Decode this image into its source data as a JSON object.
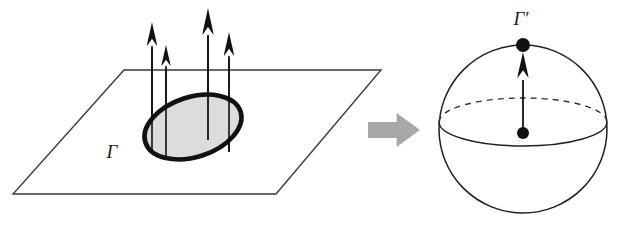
{
  "figure": {
    "kind": "mathematical-diagram",
    "width": 625,
    "height": 226,
    "background_color": "#ffffff"
  },
  "colors": {
    "stroke": "#231f20",
    "curve_stroke": "#111111",
    "curve_fill": "#dcdcdc",
    "plane_stroke": "#3a3a3a",
    "arrow_fill": "#111111",
    "map_arrow_fill": "#a8a8a8",
    "dash_stroke": "#333333",
    "label_color": "#1a1a1a"
  },
  "left_panel": {
    "name": "plane-with-closed-curve",
    "plane": {
      "name": "plane",
      "points": "124,70 381,70 276,194 13,194",
      "stroke_width": 1.4
    },
    "curve": {
      "name": "closed-curve-gamma",
      "center_x": 193,
      "center_y": 127,
      "radius_x": 50,
      "radius_y": 30,
      "rotation_deg": -18,
      "stroke_width": 4.6
    },
    "curve_label": {
      "text": "Γ",
      "x": 112,
      "y": 158,
      "font_size": 19
    },
    "vectors": [
      {
        "name": "normal-vector-1",
        "x": 152,
        "y_base": 152,
        "y_tip": 22,
        "head_width": 10,
        "head_length": 24,
        "shaft_width": 1.6
      },
      {
        "name": "normal-vector-2",
        "x": 166,
        "y_base": 160,
        "y_tip": 45,
        "head_width": 9,
        "head_length": 21,
        "shaft_width": 1.6
      },
      {
        "name": "normal-vector-3",
        "x": 208,
        "y_base": 140,
        "y_tip": 8,
        "head_width": 11,
        "head_length": 27,
        "shaft_width": 1.8
      },
      {
        "name": "normal-vector-4",
        "x": 229,
        "y_base": 152,
        "y_tip": 32,
        "head_width": 10,
        "head_length": 24,
        "shaft_width": 1.6
      }
    ]
  },
  "map_arrow": {
    "name": "maps-to-arrow",
    "x": 368,
    "y": 113,
    "width": 52,
    "height": 34,
    "tail_height": 16,
    "fill": "#a8a8a8"
  },
  "right_panel": {
    "name": "sphere-with-image-point",
    "sphere": {
      "name": "sphere-outline",
      "center_x": 523,
      "center_y": 129,
      "radius": 84,
      "stroke_width": 1.5
    },
    "equator": {
      "name": "equator-ellipse",
      "center_x": 523,
      "center_y": 122,
      "radius_x": 84,
      "radius_y": 24,
      "back_dashed": true,
      "dash_pattern": "6 5",
      "stroke_width": 1.4
    },
    "center_point": {
      "name": "sphere-center-point",
      "x": 523,
      "y": 133,
      "r": 6
    },
    "image_point": {
      "name": "image-point-gamma-prime",
      "x": 523,
      "y": 45,
      "r": 7
    },
    "vector": {
      "name": "image-normal-vector",
      "x": 523,
      "y_base": 133,
      "y_tip": 52,
      "head_width": 11,
      "head_length": 26,
      "shaft_width": 1.8
    },
    "point_label": {
      "text": "Γ′",
      "x": 521,
      "y": 25,
      "font_size": 19
    }
  }
}
